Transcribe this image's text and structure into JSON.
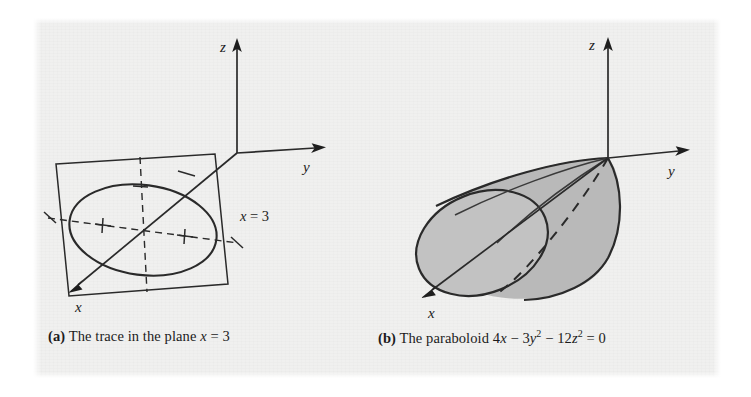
{
  "figure": {
    "background_color": "#f0f0ef",
    "ink_color": "#2a2a2a",
    "surface_fill_color": "#b9b9b9"
  },
  "panel_a": {
    "id": "panel-a",
    "caption": {
      "tag": "(a)",
      "text_before": " The trace in the plane ",
      "variable": "x",
      "text_after": " = 3"
    },
    "axes": [
      {
        "name": "z",
        "label": "z",
        "direction": "up"
      },
      {
        "name": "y",
        "label": "y",
        "direction": "right"
      },
      {
        "name": "x",
        "label": "x",
        "direction": "down-left"
      }
    ],
    "plane_label": {
      "variable": "x",
      "equals": " = 3"
    },
    "shapes": {
      "plane": "parallelogram",
      "curve": "ellipse",
      "focus_markers": 2,
      "dashed_axes": 2,
      "tick_marks": 3
    }
  },
  "panel_b": {
    "id": "panel-b",
    "caption": {
      "tag": "(b)",
      "text_before": " The paraboloid 4",
      "var_x": "x",
      "minus1": " − 3",
      "var_y": "y",
      "exp_y": "2",
      "minus2": " − 12",
      "var_z": "z",
      "exp_z": "2",
      "equals": " = 0"
    },
    "axes": [
      {
        "name": "z",
        "label": "z",
        "direction": "up"
      },
      {
        "name": "y",
        "label": "y",
        "direction": "right"
      },
      {
        "name": "x",
        "label": "x",
        "direction": "down-left"
      }
    ],
    "shapes": {
      "surface": "elliptic-paraboloid",
      "opening_direction": "+x",
      "vertex_at_origin": true,
      "end_cap": "ellipse",
      "ruling_lines": 3,
      "hidden_dashed_line": 1
    }
  }
}
